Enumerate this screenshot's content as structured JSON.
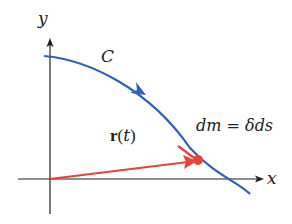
{
  "diagram": {
    "axes": {
      "x_label": "x",
      "y_label": "y"
    },
    "curve": {
      "label": "C",
      "color": "#2a62c4"
    },
    "position_vector": {
      "label_bold": "r",
      "label_paren_open": "(",
      "label_var": "t",
      "label_paren_close": ")",
      "color": "#e8423a"
    },
    "mass_element": {
      "label": "dm = δds",
      "color": "#e8423a"
    },
    "axis_color": "#222222"
  }
}
